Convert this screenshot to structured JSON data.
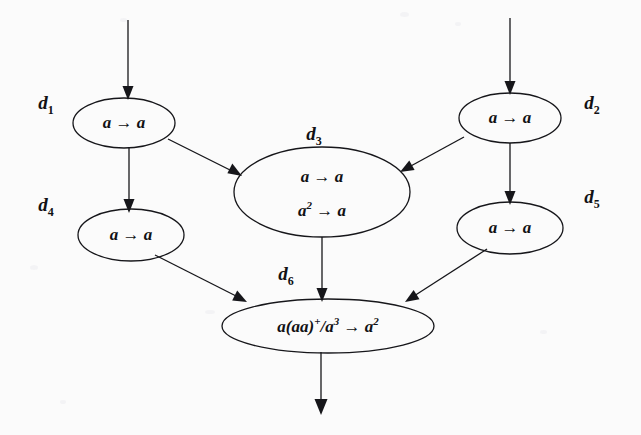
{
  "diagram": {
    "background_color": "#fbfbfb",
    "ink_color": "#16161a",
    "nodes": [
      {
        "id": "d1",
        "label": "d",
        "label_sub": "1",
        "label_x": 46,
        "label_y": 105,
        "cx": 124,
        "cy": 123,
        "rx": 51,
        "ry": 25,
        "lines": [
          {
            "text": "a → a",
            "sup": "",
            "tail": ""
          }
        ]
      },
      {
        "id": "d2",
        "label": "d",
        "label_sub": "2",
        "label_x": 592,
        "label_y": 105,
        "cx": 510,
        "cy": 118,
        "rx": 51,
        "ry": 25,
        "lines": [
          {
            "text": "a → a",
            "sup": "",
            "tail": ""
          }
        ]
      },
      {
        "id": "d3",
        "label": "d",
        "label_sub": "3",
        "label_x": 314,
        "label_y": 135,
        "cx": 322,
        "cy": 192,
        "rx": 88,
        "ry": 45,
        "lines": [
          {
            "text": "a → a",
            "sup": "",
            "tail": ""
          },
          {
            "text": "a",
            "sup": "2",
            "tail": " → a"
          }
        ]
      },
      {
        "id": "d4",
        "label": "d",
        "label_sub": "4",
        "label_x": 46,
        "label_y": 207,
        "cx": 131,
        "cy": 235,
        "rx": 53,
        "ry": 26,
        "lines": [
          {
            "text": "a → a",
            "sup": "",
            "tail": ""
          }
        ]
      },
      {
        "id": "d5",
        "label": "d",
        "label_sub": "5",
        "label_x": 592,
        "label_y": 199,
        "cx": 510,
        "cy": 228,
        "rx": 53,
        "ry": 26,
        "lines": [
          {
            "text": "a → a",
            "sup": "",
            "tail": ""
          }
        ]
      },
      {
        "id": "d6",
        "label": "d",
        "label_sub": "6",
        "label_x": 286,
        "label_y": 276,
        "cx": 328,
        "cy": 326,
        "rx": 106,
        "ry": 27,
        "lines": [
          {
            "text": "a(aa)",
            "sup": "+",
            "tail": "/a",
            "sup2": "3",
            "tail2": " → a",
            "sup3": "2"
          }
        ]
      }
    ],
    "edges": [
      {
        "id": "input-to-d1",
        "from": "external-top-left",
        "to": "d1"
      },
      {
        "id": "input-to-d2",
        "from": "external-top-right",
        "to": "d2"
      },
      {
        "id": "d1-to-d4",
        "from": "d1",
        "to": "d4"
      },
      {
        "id": "d1-to-d3",
        "from": "d1",
        "to": "d3"
      },
      {
        "id": "d2-to-d5",
        "from": "d2",
        "to": "d5"
      },
      {
        "id": "d2-to-d3",
        "from": "d2",
        "to": "d3"
      },
      {
        "id": "d3-to-d6",
        "from": "d3",
        "to": "d6"
      },
      {
        "id": "d4-to-d6",
        "from": "d4",
        "to": "d6"
      },
      {
        "id": "d5-to-d6",
        "from": "d5",
        "to": "d6"
      },
      {
        "id": "d6-to-output",
        "from": "d6",
        "to": "external-bottom"
      }
    ]
  }
}
